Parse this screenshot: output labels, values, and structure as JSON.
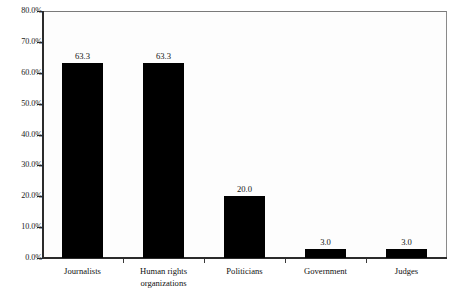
{
  "chart_data": {
    "type": "bar",
    "title": "",
    "subtitle": "",
    "xlabel": "",
    "ylabel": "",
    "categories": [
      "Journalists",
      "Human rights organizations",
      "Politicians",
      "Government",
      "Judges"
    ],
    "category_lines": [
      [
        "Journalists"
      ],
      [
        "Human rights",
        "organizations"
      ],
      [
        "Politicians"
      ],
      [
        "Government"
      ],
      [
        "Judges"
      ]
    ],
    "values": [
      63.3,
      63.3,
      20.0,
      3.0,
      3.0
    ],
    "data_labels": [
      "63.3",
      "63.3",
      "20.0",
      "3.0",
      "3.0"
    ],
    "ylim": [
      0,
      80
    ],
    "ytick_values": [
      0,
      10,
      20,
      30,
      40,
      50,
      60,
      70,
      80
    ],
    "ytick_labels": [
      "0.0%",
      "10.0%",
      "20.0%",
      "30.0%",
      "40.0%",
      "50.0%",
      "60.0%",
      "70.0%",
      "80.0%"
    ],
    "grid": false,
    "legend": null,
    "bar_color": "#000000",
    "axis_color": "#2b2b2b",
    "plot_background": "#fdfdfd",
    "page_background": "#ffffff"
  }
}
